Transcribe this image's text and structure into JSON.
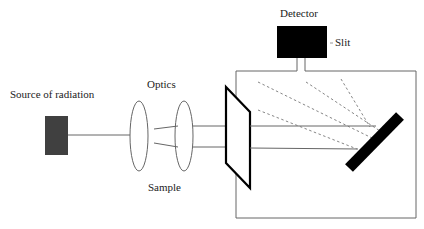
{
  "labels": {
    "source": "Source of radiation",
    "optics": "Optics",
    "sample": "Sample",
    "detector": "Detector",
    "slit": "Slit"
  },
  "colors": {
    "source_fill": "#404040",
    "detector_fill": "#000000",
    "grating_fill": "#000000",
    "line": "#555555",
    "dashed": "#777777"
  }
}
